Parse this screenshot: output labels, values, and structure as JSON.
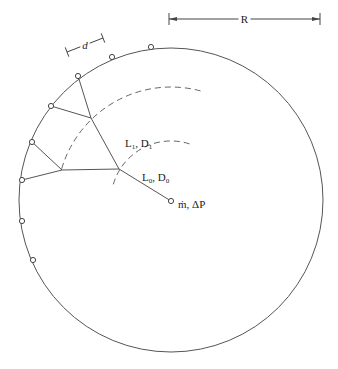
{
  "diagram": {
    "type": "radial-branching-network",
    "circle": {
      "cx": 171,
      "cy": 200,
      "r": 152,
      "stroke": "#555555"
    },
    "dimension_R": {
      "label": "R",
      "x1": 169,
      "x2": 320,
      "y": 19
    },
    "dimension_d": {
      "label": "d",
      "x1": 67,
      "y1": 52,
      "x2": 103,
      "y2": 38
    },
    "dashed_arcs": [
      {
        "name": "inner",
        "r": 60,
        "start_deg": -72,
        "end_deg": -165
      },
      {
        "name": "outer",
        "r": 114,
        "start_deg": -75,
        "end_deg": -165
      }
    ],
    "inlet": {
      "x": 171,
      "y": 201,
      "label_m": "ṁ",
      "label_rest": ", ΔP"
    },
    "junctions": [
      {
        "id": "J0",
        "x": 119,
        "y": 169
      },
      {
        "id": "J1a",
        "x": 91,
        "y": 118
      },
      {
        "id": "J1b",
        "x": 62,
        "y": 170
      }
    ],
    "outlets": [
      {
        "x": 151,
        "y": 47
      },
      {
        "x": 112,
        "y": 57
      },
      {
        "x": 78,
        "y": 76
      },
      {
        "x": 51,
        "y": 106
      },
      {
        "x": 32,
        "y": 142
      },
      {
        "x": 22,
        "y": 180
      },
      {
        "x": 22,
        "y": 221
      },
      {
        "x": 33,
        "y": 260
      }
    ],
    "segments": [
      {
        "from": [
          171,
          201
        ],
        "to": [
          119,
          169
        ]
      },
      {
        "from": [
          119,
          169
        ],
        "to": [
          91,
          118
        ]
      },
      {
        "from": [
          119,
          169
        ],
        "to": [
          62,
          170
        ]
      },
      {
        "from": [
          91,
          118
        ],
        "to": [
          78,
          76
        ]
      },
      {
        "from": [
          91,
          118
        ],
        "to": [
          51,
          106
        ]
      },
      {
        "from": [
          62,
          170
        ],
        "to": [
          32,
          142
        ]
      },
      {
        "from": [
          62,
          170
        ],
        "to": [
          22,
          180
        ]
      }
    ],
    "labels": {
      "L0_main": "L",
      "L0_sub": "0",
      "D0_main": "D",
      "D0_sub": "0",
      "L1_main": "L",
      "L1_sub": "1",
      "D1_main": "D",
      "D1_sub": "1",
      "sep": ", "
    }
  }
}
